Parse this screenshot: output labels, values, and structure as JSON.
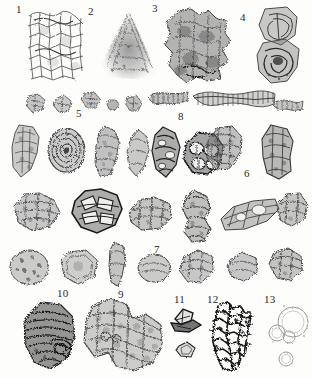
{
  "plate": {
    "caption_visible": false,
    "background_color": "#fdfdfc",
    "ink_color": "#3a3a3a",
    "width_px": 312,
    "height_px": 378,
    "figure_type": "grayscale micrograph plate of microfossil / palynological specimens"
  },
  "labels": [
    {
      "id": "1",
      "text": "1",
      "x": 16,
      "y": 4,
      "description": "large reticulate cellular tissue fragment, upper left"
    },
    {
      "id": "2",
      "text": "2",
      "x": 88,
      "y": 6,
      "description": "dark triangular granular mass, upper centre-left"
    },
    {
      "id": "3",
      "text": "3",
      "x": 152,
      "y": 3,
      "description": "large lobate dark-grey clast, upper centre-right"
    },
    {
      "id": "4",
      "text": "4",
      "x": 240,
      "y": 12,
      "description": "twin-lobed coiled specimen, upper right"
    },
    {
      "id": "5",
      "text": "5",
      "x": 76,
      "y": 108,
      "description": "row of small irregular angular grains"
    },
    {
      "id": "6",
      "text": "6",
      "x": 244,
      "y": 168,
      "description": "elongate clast at right of second specimen row"
    },
    {
      "id": "7",
      "text": "7",
      "x": 154,
      "y": 244,
      "description": "row of elongate and coiled fragments"
    },
    {
      "id": "8",
      "text": "8",
      "x": 178,
      "y": 111,
      "description": "striated filamentous / annulated elongate specimens"
    },
    {
      "id": "9",
      "text": "9",
      "x": 118,
      "y": 289,
      "description": "large pitted dumbbell-shaped clast, lower centre"
    },
    {
      "id": "10",
      "text": "10",
      "x": 57,
      "y": 288,
      "description": "dark banded rounded specimen, lower left"
    },
    {
      "id": "11",
      "text": "11",
      "x": 174,
      "y": 294,
      "description": "small angular crystal fragments, lower right"
    },
    {
      "id": "12",
      "text": "12",
      "x": 207,
      "y": 294,
      "description": "dark branching skeletal framework"
    },
    {
      "id": "13",
      "text": "13",
      "x": 264,
      "y": 294,
      "description": "faint spherical vesicles / bubbles"
    }
  ],
  "specimen_groups": [
    {
      "number": "1",
      "row": 1,
      "count": 1,
      "tone": "light reticulate"
    },
    {
      "number": "2",
      "row": 1,
      "count": 1,
      "tone": "medium granular"
    },
    {
      "number": "3",
      "row": 1,
      "count": 1,
      "tone": "dark lobate"
    },
    {
      "number": "4",
      "row": 1,
      "count": 1,
      "tone": "medium coiled"
    },
    {
      "number": "5",
      "row": 2,
      "count": 6,
      "tone": "light angular grains"
    },
    {
      "number": "8",
      "row": 2,
      "count": 2,
      "tone": "striated elongate"
    },
    {
      "number": "6",
      "row": 3,
      "count": 7,
      "tone": "mixed dark and light clasts"
    },
    {
      "number": "7",
      "row": 4,
      "count": 9,
      "tone": "light porous clasts"
    },
    {
      "number": "9",
      "row": 5,
      "count": 1,
      "tone": "large pitted mass"
    },
    {
      "number": "10",
      "row": 5,
      "count": 1,
      "tone": "dark banded"
    },
    {
      "number": "11",
      "row": 5,
      "count": 2,
      "tone": "angular crystals"
    },
    {
      "number": "12",
      "row": 5,
      "count": 1,
      "tone": "dark skeletal"
    },
    {
      "number": "13",
      "row": 5,
      "count": 4,
      "tone": "faint spheres"
    }
  ]
}
